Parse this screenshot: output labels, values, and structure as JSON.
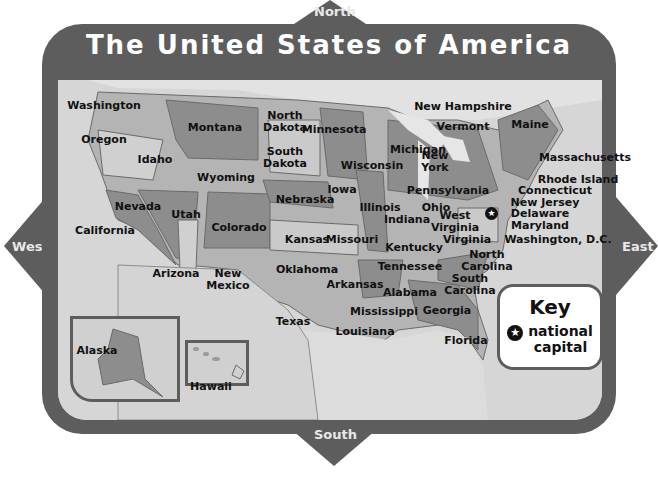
{
  "title": "The United States of America",
  "compass": {
    "north": "North",
    "south": "South",
    "east": "East",
    "west": "West"
  },
  "states": [
    {
      "name": "Washington",
      "x": 104,
      "y": 106
    },
    {
      "name": "Oregon",
      "x": 104,
      "y": 140
    },
    {
      "name": "Idaho",
      "x": 155,
      "y": 160
    },
    {
      "name": "Montana",
      "x": 215,
      "y": 128
    },
    {
      "name": "North Dakota",
      "x": 285,
      "y": 122
    },
    {
      "name": "South Dakota",
      "x": 285,
      "y": 158
    },
    {
      "name": "Wyoming",
      "x": 226,
      "y": 178
    },
    {
      "name": "Minnesota",
      "x": 334,
      "y": 130
    },
    {
      "name": "Wisconsin",
      "x": 372,
      "y": 166
    },
    {
      "name": "Michigan",
      "x": 418,
      "y": 150
    },
    {
      "name": "Iowa",
      "x": 342,
      "y": 190
    },
    {
      "name": "Nebraska",
      "x": 305,
      "y": 200
    },
    {
      "name": "Nevada",
      "x": 138,
      "y": 207
    },
    {
      "name": "Utah",
      "x": 186,
      "y": 215
    },
    {
      "name": "Colorado",
      "x": 239,
      "y": 228
    },
    {
      "name": "California",
      "x": 105,
      "y": 231
    },
    {
      "name": "Kansas",
      "x": 307,
      "y": 240
    },
    {
      "name": "Missouri",
      "x": 352,
      "y": 240
    },
    {
      "name": "Illinois",
      "x": 380,
      "y": 208
    },
    {
      "name": "Indiana",
      "x": 407,
      "y": 220
    },
    {
      "name": "Ohio",
      "x": 436,
      "y": 208
    },
    {
      "name": "Pennsylvania",
      "x": 448,
      "y": 191
    },
    {
      "name": "New York",
      "x": 435,
      "y": 162
    },
    {
      "name": "West Virginia",
      "x": 455,
      "y": 222
    },
    {
      "name": "Virginia",
      "x": 467,
      "y": 240
    },
    {
      "name": "Kentucky",
      "x": 414,
      "y": 248
    },
    {
      "name": "Tennessee",
      "x": 410,
      "y": 267
    },
    {
      "name": "North Carolina",
      "x": 487,
      "y": 261
    },
    {
      "name": "South Carolina",
      "x": 470,
      "y": 285
    },
    {
      "name": "Arizona",
      "x": 176,
      "y": 274
    },
    {
      "name": "New Mexico",
      "x": 228,
      "y": 280
    },
    {
      "name": "Oklahoma",
      "x": 307,
      "y": 270
    },
    {
      "name": "Arkansas",
      "x": 355,
      "y": 285
    },
    {
      "name": "Alabama",
      "x": 410,
      "y": 293
    },
    {
      "name": "Mississippi",
      "x": 384,
      "y": 312
    },
    {
      "name": "Georgia",
      "x": 447,
      "y": 311
    },
    {
      "name": "Louisiana",
      "x": 365,
      "y": 332
    },
    {
      "name": "Texas",
      "x": 293,
      "y": 322
    },
    {
      "name": "Florida",
      "x": 466,
      "y": 341
    },
    {
      "name": "Alaska",
      "x": 97,
      "y": 351
    },
    {
      "name": "Hawaii",
      "x": 211,
      "y": 387
    },
    {
      "name": "New Hampshire",
      "x": 463,
      "y": 107
    },
    {
      "name": "Vermont",
      "x": 463,
      "y": 127
    },
    {
      "name": "Maine",
      "x": 530,
      "y": 125
    },
    {
      "name": "Massachusetts",
      "x": 585,
      "y": 158
    },
    {
      "name": "Rhode Island",
      "x": 578,
      "y": 180
    },
    {
      "name": "Connecticut",
      "x": 555,
      "y": 191
    },
    {
      "name": "New Jersey",
      "x": 545,
      "y": 203
    },
    {
      "name": "Delaware",
      "x": 540,
      "y": 214
    },
    {
      "name": "Maryland",
      "x": 540,
      "y": 226
    },
    {
      "name": "Washington, D.C.",
      "x": 558,
      "y": 240
    }
  ],
  "key": {
    "title": "Key",
    "symbol": "star-in-circle",
    "label_line1": "national",
    "label_line2": "capital"
  },
  "colors": {
    "frame": "#5d5d5d",
    "map_bg": "#d9d9d9",
    "state_dark": "#8a8a8a",
    "state_mid": "#b0b0b0",
    "state_light": "#cfcfcf"
  }
}
